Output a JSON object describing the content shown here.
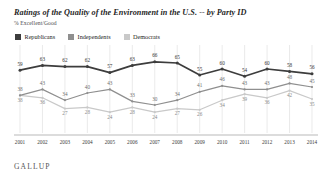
{
  "header": {
    "title": "Ratings of the Quality of the Environment in the U.S. -- by Party ID",
    "subtitle": "% Excellent/Good"
  },
  "footer": {
    "brand": "GALLUP"
  },
  "legend": [
    {
      "label": "Republicans",
      "color": "#3d3d3d"
    },
    {
      "label": "Independents",
      "color": "#8f8f8f"
    },
    {
      "label": "Democrats",
      "color": "#c9c9c9"
    }
  ],
  "chart_data": {
    "type": "line",
    "title": "Ratings of the Quality of the Environment in the U.S. -- by Party ID",
    "subtitle": "% Excellent/Good",
    "xlabel": "",
    "ylabel": "% Excellent/Good",
    "ylim": [
      20,
      70
    ],
    "grid": true,
    "grid_axis": "x",
    "legend_position": "top-left",
    "categories": [
      "2001",
      "2002",
      "2003",
      "2004",
      "2005",
      "2006",
      "2007",
      "2008",
      "2009",
      "2010",
      "2011",
      "2012",
      "2013",
      "2014"
    ],
    "series": [
      {
        "name": "Republicans",
        "color": "#3d3d3d",
        "values": [
          59,
          63,
          62,
          62,
          57,
          63,
          66,
          65,
          55,
          60,
          54,
          60,
          58,
          56
        ]
      },
      {
        "name": "Independents",
        "color": "#8f8f8f",
        "values": [
          38,
          43,
          34,
          40,
          43,
          33,
          30,
          34,
          41,
          46,
          43,
          43,
          48,
          45
        ]
      },
      {
        "name": "Democrats",
        "color": "#c9c9c9",
        "values": [
          38,
          36,
          27,
          28,
          24,
          28,
          24,
          27,
          26,
          34,
          39,
          36,
          42,
          35
        ]
      }
    ]
  }
}
